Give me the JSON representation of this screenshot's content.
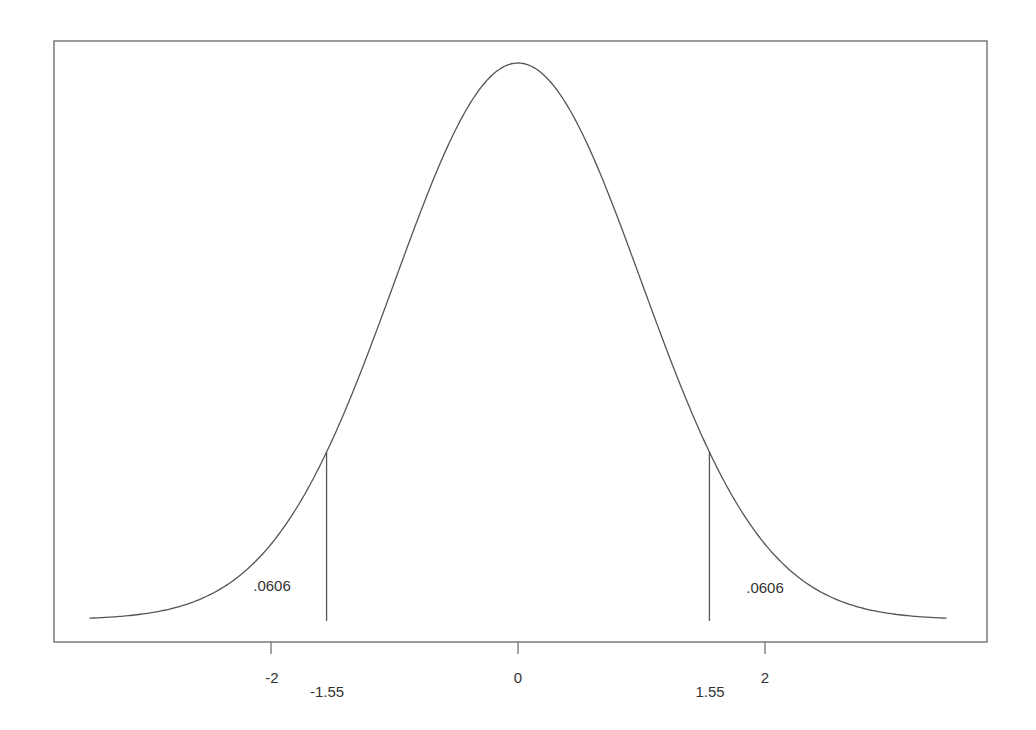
{
  "chart_data": {
    "type": "line",
    "title": "",
    "xlabel": "",
    "ylabel": "",
    "xlim": [
      -3.47,
      3.47
    ],
    "x_ticks": [
      {
        "value": -2,
        "label": "-2"
      },
      {
        "value": 0,
        "label": "0"
      },
      {
        "value": 2,
        "label": "2"
      }
    ],
    "critical_values": [
      {
        "value": -1.55,
        "label": "-1.55"
      },
      {
        "value": 1.55,
        "label": "1.55"
      }
    ],
    "tail_areas": [
      {
        "side": "left",
        "label": ".0606",
        "value": 0.0606
      },
      {
        "side": "right",
        "label": ".0606",
        "value": 0.0606
      }
    ],
    "series": [
      {
        "name": "standard normal pdf",
        "mean": 0,
        "sd": 1
      }
    ],
    "grid": false,
    "legend": null
  },
  "colors": {
    "line": "#555555",
    "frame": "#666666",
    "text": "#333333"
  }
}
